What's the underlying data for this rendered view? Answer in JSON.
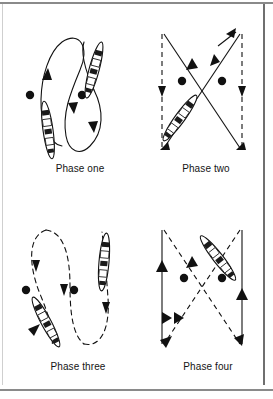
{
  "figure": {
    "kind": "instructional-diagram",
    "background_color": "#ffffff",
    "ink_color": "#111111",
    "frame_color": "#8a8a8a",
    "panel_count": 4
  },
  "panels": [
    {
      "id": "phase-one",
      "caption": "Phase one",
      "path_style": "solid",
      "pattern": "figure-eight",
      "buoys": 2,
      "boats": 2,
      "arrows": 3
    },
    {
      "id": "phase-two",
      "caption": "Phase two",
      "path_style": "mixed-dashed-solid",
      "pattern": "crossing-x",
      "buoys": 2,
      "boats": 1,
      "arrows": 7
    },
    {
      "id": "phase-three",
      "caption": "Phase three",
      "path_style": "dashed",
      "pattern": "figure-eight",
      "buoys": 2,
      "boats": 2,
      "arrows": 4
    },
    {
      "id": "phase-four",
      "caption": "Phase four",
      "path_style": "mixed-dashed-solid",
      "pattern": "crossing-x",
      "buoys": 2,
      "boats": 1,
      "arrows": 7
    }
  ],
  "captions": {
    "phase_one": "Phase one",
    "phase_two": "Phase two",
    "phase_three": "Phase three",
    "phase_four": "Phase four"
  }
}
